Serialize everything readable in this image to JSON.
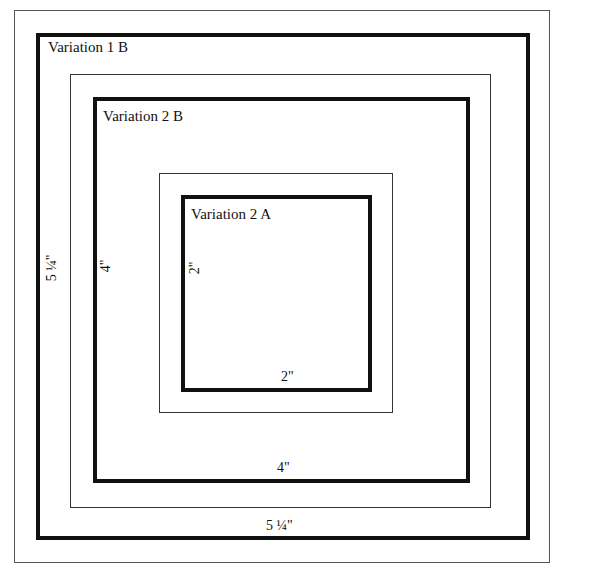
{
  "diagram": {
    "boxes": [
      {
        "id": "outer-frame",
        "style": "thin-frame"
      },
      {
        "id": "variation-1b",
        "label": "Variation 1 B",
        "style": "thick"
      },
      {
        "id": "mat-1",
        "style": "thin"
      },
      {
        "id": "variation-2b",
        "label": "Variation 2 B",
        "style": "thick"
      },
      {
        "id": "mat-2",
        "style": "thin"
      },
      {
        "id": "variation-2a",
        "label": "Variation 2 A",
        "style": "thick"
      }
    ],
    "dimensions": {
      "variation_1b_width": "5 ¼\"",
      "variation_1b_height": "5 ¼\"",
      "variation_2b_width": "4\"",
      "variation_2b_height": "4\"",
      "variation_2a_width": "2\"",
      "variation_2a_height": "2\""
    },
    "colors": {
      "line": "#111111",
      "frame": "#555555",
      "background": "#ffffff"
    }
  }
}
